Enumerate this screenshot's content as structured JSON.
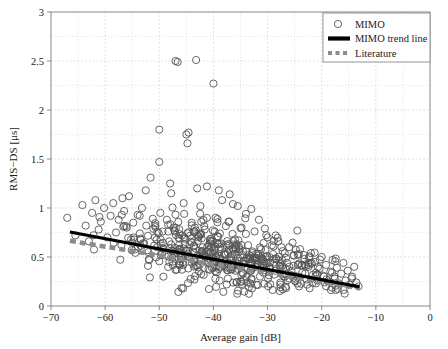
{
  "chart_data": {
    "type": "scatter",
    "title": "",
    "xlabel": "Average gain [dB]",
    "ylabel": "RMS−DS [μs]",
    "xlim": [
      -70,
      0
    ],
    "ylim": [
      0,
      3
    ],
    "xticks": [
      -70,
      -60,
      -50,
      -40,
      -30,
      -20,
      -10,
      0
    ],
    "xticklabels": [
      "−70",
      "−60",
      "−50",
      "−40",
      "−30",
      "−20",
      "−10",
      "0"
    ],
    "yticks": [
      0,
      0.5,
      1,
      1.5,
      2,
      2.5,
      3
    ],
    "yticklabels": [
      "0",
      "0.5",
      "1",
      "1.5",
      "2",
      "2.5",
      "3"
    ],
    "grid": "major and minor dotted light gray",
    "legend_position": "top right",
    "legend": [
      {
        "label": "MIMO",
        "marker": "open-circle",
        "color": "#555555"
      },
      {
        "label": "MIMO trend line",
        "marker": "thick-solid-line",
        "color": "#000000"
      },
      {
        "label": "Literature",
        "marker": "thick-dashed-line",
        "color": "#8c8c8c"
      }
    ],
    "series": [
      {
        "name": "MIMO",
        "marker": "open-circle",
        "color": "#555555",
        "points": [
          [
            -67.0,
            0.9
          ],
          [
            -65.5,
            0.72
          ],
          [
            -64.2,
            1.03
          ],
          [
            -63.6,
            0.82
          ],
          [
            -63.0,
            0.66
          ],
          [
            -62.4,
            0.95
          ],
          [
            -61.8,
            1.08
          ],
          [
            -61.2,
            0.78
          ],
          [
            -60.8,
            0.86
          ],
          [
            -60.2,
            1.0
          ],
          [
            -59.6,
            0.7
          ],
          [
            -59.0,
            0.92
          ],
          [
            -58.5,
            1.05
          ],
          [
            -58.0,
            0.75
          ],
          [
            -57.5,
            0.88
          ],
          [
            -57.0,
            0.62
          ],
          [
            -56.5,
            0.97
          ],
          [
            -56.0,
            0.8
          ],
          [
            -55.6,
            1.12
          ],
          [
            -55.2,
            0.68
          ],
          [
            -54.8,
            0.85
          ],
          [
            -54.4,
            0.58
          ],
          [
            -54.0,
            0.93
          ],
          [
            -53.6,
            0.74
          ],
          [
            -53.2,
            1.0
          ],
          [
            -52.8,
            0.64
          ],
          [
            -52.4,
            0.82
          ],
          [
            -52.0,
            0.55
          ],
          [
            -51.6,
            1.31
          ],
          [
            -51.2,
            0.89
          ],
          [
            -50.8,
            0.7
          ],
          [
            -50.4,
            0.6
          ],
          [
            -50.0,
            1.8
          ],
          [
            -50.0,
            1.47
          ],
          [
            -49.8,
            0.95
          ],
          [
            -49.4,
            0.76
          ],
          [
            -49.0,
            0.52
          ],
          [
            -48.6,
            0.88
          ],
          [
            -48.2,
            0.66
          ],
          [
            -47.8,
            1.15
          ],
          [
            -47.4,
            0.8
          ],
          [
            -47.0,
            2.5
          ],
          [
            -46.6,
            2.49
          ],
          [
            -46.2,
            0.58
          ],
          [
            -45.8,
            0.72
          ],
          [
            -45.4,
            0.94
          ],
          [
            -45.0,
            1.75
          ],
          [
            -44.8,
            1.66
          ],
          [
            -44.6,
            1.77
          ],
          [
            -44.4,
            0.63
          ],
          [
            -44.0,
            0.85
          ],
          [
            -43.6,
            0.48
          ],
          [
            -43.2,
            2.51
          ],
          [
            -42.8,
            0.7
          ],
          [
            -42.4,
            1.02
          ],
          [
            -42.0,
            0.56
          ],
          [
            -41.6,
            0.78
          ],
          [
            -41.2,
            1.22
          ],
          [
            -40.8,
            0.44
          ],
          [
            -40.4,
            0.66
          ],
          [
            -40.0,
            2.27
          ],
          [
            -39.6,
            0.9
          ],
          [
            -39.2,
            0.52
          ],
          [
            -38.8,
            0.74
          ],
          [
            -38.4,
            1.08
          ],
          [
            -38.0,
            0.4
          ],
          [
            -37.6,
            0.62
          ],
          [
            -37.2,
            0.86
          ],
          [
            -36.8,
            0.5
          ],
          [
            -36.4,
            1.04
          ],
          [
            -36.0,
            0.68
          ],
          [
            -35.6,
            0.38
          ],
          [
            -35.2,
            0.58
          ],
          [
            -34.8,
            0.8
          ],
          [
            -34.4,
            0.46
          ],
          [
            -34.0,
            0.94
          ],
          [
            -33.6,
            0.62
          ],
          [
            -33.2,
            0.36
          ],
          [
            -32.8,
            0.54
          ],
          [
            -32.4,
            0.76
          ],
          [
            -32.0,
            0.42
          ],
          [
            -31.6,
            0.88
          ],
          [
            -31.2,
            0.58
          ],
          [
            -30.8,
            0.34
          ],
          [
            -30.4,
            0.5
          ],
          [
            -30.0,
            0.7
          ],
          [
            -29.6,
            0.4
          ],
          [
            -29.2,
            0.62
          ],
          [
            -28.8,
            0.32
          ],
          [
            -28.4,
            0.48
          ],
          [
            -28.0,
            0.66
          ],
          [
            -27.6,
            0.38
          ],
          [
            -27.2,
            0.56
          ],
          [
            -26.8,
            0.3
          ],
          [
            -26.4,
            0.44
          ],
          [
            -26.0,
            0.6
          ],
          [
            -25.6,
            0.36
          ],
          [
            -25.2,
            0.52
          ],
          [
            -24.8,
            0.28
          ],
          [
            -24.4,
            0.42
          ],
          [
            -24.0,
            0.58
          ],
          [
            -23.6,
            0.34
          ],
          [
            -23.2,
            0.48
          ],
          [
            -22.8,
            0.27
          ],
          [
            -22.4,
            0.4
          ],
          [
            -22.0,
            0.54
          ],
          [
            -21.6,
            0.32
          ],
          [
            -21.2,
            0.45
          ],
          [
            -20.8,
            0.26
          ],
          [
            -20.4,
            0.38
          ],
          [
            -20.0,
            0.5
          ],
          [
            -19.6,
            0.3
          ],
          [
            -19.2,
            0.42
          ],
          [
            -18.8,
            0.25
          ],
          [
            -18.4,
            0.35
          ],
          [
            -18.0,
            0.47
          ],
          [
            -17.6,
            0.28
          ],
          [
            -17.2,
            0.39
          ],
          [
            -16.8,
            0.23
          ],
          [
            -16.4,
            0.33
          ],
          [
            -16.0,
            0.44
          ],
          [
            -15.6,
            0.26
          ],
          [
            -15.2,
            0.36
          ],
          [
            -14.8,
            0.22
          ],
          [
            -14.4,
            0.3
          ],
          [
            -14.0,
            0.4
          ],
          [
            -13.6,
            0.24
          ],
          [
            -13.2,
            0.2
          ],
          [
            -30.5,
            0.79
          ],
          [
            -28.5,
            0.72
          ],
          [
            -24.5,
            0.77
          ],
          [
            -33.0,
            0.99
          ],
          [
            -35.5,
            1.02
          ],
          [
            -37.0,
            1.14
          ],
          [
            -39.0,
            1.18
          ],
          [
            -43.0,
            1.2
          ],
          [
            -45.5,
            1.05
          ],
          [
            -48.0,
            1.25
          ],
          [
            -52.5,
            1.18
          ],
          [
            -56.8,
            1.1
          ]
        ]
      }
    ],
    "trend_lines": [
      {
        "name": "MIMO trend line",
        "style": "solid",
        "color": "#000000",
        "width": 3.2,
        "x0": -66.5,
        "y0": 0.755,
        "x1": -13.0,
        "y1": 0.195
      },
      {
        "name": "Literature",
        "style": "dashed",
        "color": "#8c8c8c",
        "width": 4.5,
        "x0": -66.5,
        "y0": 0.665,
        "x1": -13.0,
        "y1": 0.18
      }
    ],
    "axes_geometry": {
      "plot_left": 51,
      "plot_right": 430,
      "plot_top": 12,
      "plot_bottom": 306
    },
    "colors": {
      "marker_edge": "#555555",
      "trend": "#000000",
      "literature": "#8c8c8c",
      "grid": "#d9d9d9",
      "axis": "#888888",
      "background": "#ffffff",
      "text": "#1a1a1a"
    }
  }
}
